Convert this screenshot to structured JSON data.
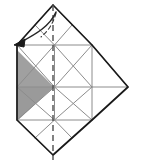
{
  "figure": {
    "kind": "origami-folding-diagram",
    "title": "Origami crease pattern step with fold arrow",
    "canvas": {
      "width": 141,
      "height": 162,
      "background": "#ffffff"
    },
    "colors": {
      "paper_fill": "#ffffff",
      "outline_stroke": "#1a1a1a",
      "crease_stroke": "#8c8c8c",
      "crease_stroke_light": "#b3b3b3",
      "shaded_fill": "#a0a0a0",
      "shaded_fill_dark": "#9a9a9a",
      "fold_line_stroke": "#4d4d4d",
      "arrow_stroke": "#262626",
      "arrow_fill": "#1a1a1a"
    },
    "geometry": {
      "square": {
        "left": 17,
        "top": 45,
        "right": 92,
        "bottom": 120
      },
      "top_apex": {
        "x": 53,
        "y": 5
      },
      "bottom_apex": {
        "x": 53,
        "y": 155
      },
      "right_apex": {
        "x": 128,
        "y": 87
      },
      "center": {
        "x": 53,
        "y": 87
      },
      "grid_divisions": 2,
      "cell_size": 37.5
    },
    "outline_points": "17,45 53,5 92,45 128,87 92,120 53,155 17,120",
    "fold_line": {
      "label": "valley-fold-centerline",
      "orientation": "vertical",
      "x": 53,
      "y1": 5,
      "y2": 160,
      "dash": "6 4",
      "width": 1.4
    },
    "shaded_regions": [
      {
        "name": "shaded-upper-triangle",
        "points": "17,50 54,87 17,87",
        "fill": "#a0a0a0"
      },
      {
        "name": "shaded-lower-triangle",
        "points": "17,87 54,87 17,121",
        "fill": "#9a9a9a"
      }
    ],
    "arrow": {
      "name": "fold-direction-arrow",
      "description": "curved arrow from top apex down to upper-left corner",
      "path": "M 56,12 C 50,26 36,34 21,42",
      "head_points": "14,45 25,39 24,47",
      "dashed_tail": "M 56,13 C 53,24 48,31 41,37"
    },
    "creases": [
      {
        "name": "crease-h-mid",
        "x1": 17,
        "y1": 87,
        "x2": 128,
        "y2": 87
      },
      {
        "name": "crease-v-left",
        "x1": 54.5,
        "y1": 45,
        "x2": 54.5,
        "y2": 120
      },
      {
        "name": "crease-h-top-cell",
        "x1": 17,
        "y1": 45,
        "x2": 92,
        "y2": 45
      },
      {
        "name": "crease-h-bottom-cell",
        "x1": 17,
        "y1": 120,
        "x2": 92,
        "y2": 120
      },
      {
        "name": "crease-v-quarter-right",
        "x1": 92,
        "y1": 45,
        "x2": 92,
        "y2": 120
      },
      {
        "name": "crease-v-quarter-left",
        "x1": 17,
        "y1": 45,
        "x2": 17,
        "y2": 120
      },
      {
        "name": "crease-diag-c1-a",
        "x1": 17,
        "y1": 45,
        "x2": 54.5,
        "y2": 87
      },
      {
        "name": "crease-diag-c1-b",
        "x1": 54.5,
        "y1": 45,
        "x2": 17,
        "y2": 87
      },
      {
        "name": "crease-diag-c2-a",
        "x1": 54.5,
        "y1": 45,
        "x2": 92,
        "y2": 87
      },
      {
        "name": "crease-diag-c2-b",
        "x1": 92,
        "y1": 45,
        "x2": 54.5,
        "y2": 87
      },
      {
        "name": "crease-diag-c3-a",
        "x1": 17,
        "y1": 87,
        "x2": 54.5,
        "y2": 120
      },
      {
        "name": "crease-diag-c3-b",
        "x1": 54.5,
        "y1": 87,
        "x2": 17,
        "y2": 120
      },
      {
        "name": "crease-diag-c4-a",
        "x1": 54.5,
        "y1": 87,
        "x2": 92,
        "y2": 120
      },
      {
        "name": "crease-diag-c4-b",
        "x1": 92,
        "y1": 87,
        "x2": 54.5,
        "y2": 120
      },
      {
        "name": "crease-top-flap-left",
        "x1": 17,
        "y1": 45,
        "x2": 53,
        "y2": 5
      },
      {
        "name": "crease-top-flap-right",
        "x1": 53,
        "y1": 5,
        "x2": 92,
        "y2": 45
      },
      {
        "name": "crease-top-flap-mid-l",
        "x1": 35,
        "y1": 25,
        "x2": 54.5,
        "y2": 45
      },
      {
        "name": "crease-top-flap-mid-r",
        "x1": 72,
        "y1": 25,
        "x2": 54.5,
        "y2": 45
      },
      {
        "name": "crease-right-flap-up",
        "x1": 92,
        "y1": 45,
        "x2": 128,
        "y2": 87
      },
      {
        "name": "crease-right-flap-dn",
        "x1": 128,
        "y1": 87,
        "x2": 92,
        "y2": 120
      },
      {
        "name": "crease-bottom-flap-l",
        "x1": 17,
        "y1": 120,
        "x2": 53,
        "y2": 155
      },
      {
        "name": "crease-bottom-flap-r",
        "x1": 53,
        "y1": 155,
        "x2": 92,
        "y2": 120
      },
      {
        "name": "crease-bottom-flap-mid-l",
        "x1": 35,
        "y1": 138,
        "x2": 54.5,
        "y2": 120
      },
      {
        "name": "crease-bottom-flap-mid-r",
        "x1": 72,
        "y1": 138,
        "x2": 54.5,
        "y2": 120
      }
    ],
    "caption": ""
  }
}
